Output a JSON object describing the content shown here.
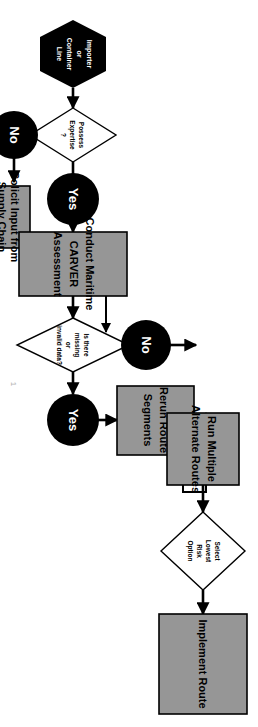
{
  "diagram": {
    "orientation": "rotated-90-clockwise",
    "colors": {
      "process_fill": "#969696",
      "process_stroke": "#000000",
      "decision_fill": "#ffffff",
      "connector": "#000000",
      "terminator_fill": "#000000",
      "connector_label_text": "#ffffff"
    },
    "nodes": [
      {
        "id": "start",
        "type": "terminator",
        "shape": "hexagon",
        "label": "Importer or Container Line",
        "lines": [
          "Importer",
          "or",
          "Container",
          "Line"
        ]
      },
      {
        "id": "d1",
        "type": "decision",
        "shape": "diamond",
        "label": "Possess Expertise ?",
        "lines": [
          "Possess",
          "Expertise",
          "?"
        ]
      },
      {
        "id": "d1-yes",
        "type": "connector",
        "shape": "circle",
        "label": "Yes",
        "lines": [
          "Yes"
        ]
      },
      {
        "id": "d1-no",
        "type": "connector",
        "shape": "circle",
        "label": "No",
        "lines": [
          "No"
        ]
      },
      {
        "id": "solicit",
        "type": "process",
        "shape": "rect",
        "label": "Solicit Input from Supply Chain Partners",
        "lines": [
          "Solicit Input from",
          "Supply Chain",
          "Partners"
        ]
      },
      {
        "id": "carver",
        "type": "process",
        "shape": "rect",
        "label": "Conduct Maritime CARVER Assessment",
        "lines": [
          "Conduct Maritime",
          "CARVER",
          "Assessment"
        ]
      },
      {
        "id": "d2",
        "type": "decision",
        "shape": "diamond",
        "label": "Is there missing or invalid data?",
        "lines": [
          "Is there",
          "missing",
          "or",
          "invalid data?"
        ]
      },
      {
        "id": "d2-yes",
        "type": "connector",
        "shape": "circle",
        "label": "Yes",
        "lines": [
          "Yes"
        ]
      },
      {
        "id": "d2-no",
        "type": "connector",
        "shape": "circle",
        "label": "No",
        "lines": [
          "No"
        ]
      },
      {
        "id": "rerun",
        "type": "process",
        "shape": "rect",
        "label": "Rerun Route Segments",
        "lines": [
          "Rerun Route",
          "Segments"
        ]
      },
      {
        "id": "runmultiple",
        "type": "process",
        "shape": "rect",
        "label": "Run Multiple Alternate Routes",
        "lines": [
          "Run Multiple",
          "Alternate Routes"
        ]
      },
      {
        "id": "d3",
        "type": "decision",
        "shape": "diamond",
        "label": "Select Lowest Risk Option",
        "lines": [
          "Select",
          "Lowest",
          "Risk",
          "Option"
        ]
      },
      {
        "id": "implement",
        "type": "process",
        "shape": "rect",
        "label": "Implement Route",
        "lines": [
          "Implement Route"
        ]
      }
    ],
    "edges": [
      {
        "from": "start",
        "to": "d1",
        "label": ""
      },
      {
        "from": "d1",
        "to": "d1-yes",
        "label": "Yes"
      },
      {
        "from": "d1",
        "to": "d1-no",
        "label": "No"
      },
      {
        "from": "d1-no",
        "to": "solicit",
        "label": ""
      },
      {
        "from": "solicit",
        "to": "carver",
        "label": ""
      },
      {
        "from": "d1-yes",
        "to": "carver",
        "label": ""
      },
      {
        "from": "carver",
        "to": "d2",
        "label": ""
      },
      {
        "from": "d2",
        "to": "d2-yes",
        "label": "Yes"
      },
      {
        "from": "d2",
        "to": "d2-no",
        "label": "No"
      },
      {
        "from": "d2-yes",
        "to": "rerun",
        "label": ""
      },
      {
        "from": "rerun",
        "to": "runmultiple",
        "label": ""
      },
      {
        "from": "d2-no",
        "to": "runmultiple",
        "label": ""
      },
      {
        "from": "runmultiple",
        "to": "d3",
        "label": ""
      },
      {
        "from": "d3",
        "to": "implement",
        "label": ""
      }
    ],
    "artifact": {
      "text": "1"
    }
  }
}
